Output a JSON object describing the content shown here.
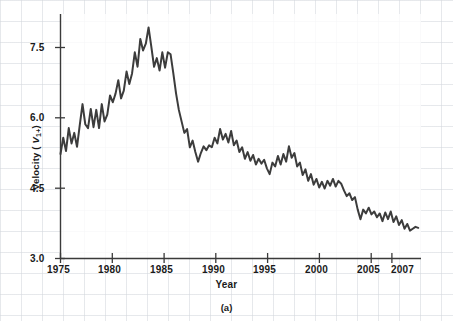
{
  "chart_data": {
    "type": "line",
    "title": "",
    "caption": "(a)",
    "xlabel": "Year",
    "ylabel_plain": "Velocity (V1+)",
    "ylabel_prefix": "Velocity ( ",
    "ylabel_var": "V",
    "ylabel_sub": "1+",
    "ylabel_suffix": ")",
    "xlim": [
      1975,
      2007.75
    ],
    "ylim": [
      3.0,
      8.1
    ],
    "xticks": [
      1975,
      1980,
      1985,
      1990,
      1995,
      2000,
      2005,
      2007
    ],
    "xtick_labels": [
      "1975",
      "1980",
      "1985",
      "1990",
      "1995",
      "2000",
      "2005",
      "2007"
    ],
    "yticks": [
      3.0,
      4.5,
      6.0,
      7.5
    ],
    "ytick_labels": [
      "3.0",
      "4.5",
      "6.0",
      "7.5"
    ],
    "grid": "faint-background-plaid",
    "legend": "none",
    "line_color": "#3c3c3c",
    "axis_color": "#3a3a3a",
    "frequency": "quarterly",
    "series": [
      {
        "name": "Velocity (V1+)",
        "x": [
          1975.0,
          1975.25,
          1975.5,
          1975.75,
          1976.0,
          1976.25,
          1976.5,
          1976.75,
          1977.0,
          1977.25,
          1977.5,
          1977.75,
          1978.0,
          1978.25,
          1978.5,
          1978.75,
          1979.0,
          1979.25,
          1979.5,
          1979.75,
          1980.0,
          1980.25,
          1980.5,
          1980.75,
          1981.0,
          1981.25,
          1981.5,
          1981.75,
          1982.0,
          1982.25,
          1982.5,
          1982.75,
          1983.0,
          1983.25,
          1983.5,
          1983.75,
          1984.0,
          1984.25,
          1984.5,
          1984.75,
          1985.0,
          1985.25,
          1985.5,
          1985.75,
          1986.0,
          1986.25,
          1986.5,
          1986.75,
          1987.0,
          1987.25,
          1987.5,
          1987.75,
          1988.0,
          1988.25,
          1988.5,
          1988.75,
          1989.0,
          1989.25,
          1989.5,
          1989.75,
          1990.0,
          1990.25,
          1990.5,
          1990.75,
          1991.0,
          1991.25,
          1991.5,
          1991.75,
          1992.0,
          1992.25,
          1992.5,
          1992.75,
          1993.0,
          1993.25,
          1993.5,
          1993.75,
          1994.0,
          1994.25,
          1994.5,
          1994.75,
          1995.0,
          1995.25,
          1995.5,
          1995.75,
          1996.0,
          1996.25,
          1996.5,
          1996.75,
          1997.0,
          1997.25,
          1997.5,
          1997.75,
          1998.0,
          1998.25,
          1998.5,
          1998.75,
          1999.0,
          1999.25,
          1999.5,
          1999.75,
          2000.0,
          2000.25,
          2000.5,
          2000.75,
          2001.0,
          2001.25,
          2001.5,
          2001.75,
          2002.0,
          2002.25,
          2002.5,
          2002.75,
          2003.0,
          2003.25,
          2003.5,
          2003.75,
          2004.0,
          2004.25,
          2004.5,
          2004.75,
          2005.0,
          2005.25,
          2005.5,
          2005.75,
          2006.0,
          2006.25,
          2006.5,
          2006.75,
          2007.0,
          2007.25,
          2007.5
        ],
        "values": [
          5.18,
          5.52,
          5.24,
          5.72,
          5.4,
          5.62,
          5.33,
          5.78,
          6.22,
          5.8,
          5.72,
          6.12,
          5.74,
          6.1,
          5.72,
          6.22,
          5.86,
          6.0,
          6.4,
          6.26,
          6.44,
          6.72,
          6.34,
          6.5,
          6.9,
          6.64,
          6.86,
          7.3,
          7.0,
          7.58,
          7.34,
          7.48,
          7.82,
          7.42,
          7.0,
          7.18,
          6.92,
          7.3,
          6.98,
          7.3,
          7.26,
          6.86,
          6.44,
          6.1,
          5.86,
          5.62,
          5.7,
          5.32,
          5.46,
          5.22,
          5.02,
          5.2,
          5.34,
          5.26,
          5.36,
          5.32,
          5.52,
          5.4,
          5.7,
          5.48,
          5.6,
          5.42,
          5.66,
          5.36,
          5.46,
          5.22,
          5.32,
          5.08,
          5.22,
          5.04,
          5.16,
          4.96,
          5.08,
          4.98,
          5.06,
          4.88,
          4.76,
          5.0,
          4.92,
          5.14,
          4.96,
          5.18,
          5.02,
          5.34,
          5.1,
          5.2,
          4.92,
          5.0,
          4.74,
          4.86,
          4.62,
          4.76,
          4.54,
          4.66,
          4.48,
          4.6,
          4.46,
          4.62,
          4.52,
          4.66,
          4.5,
          4.62,
          4.56,
          4.42,
          4.3,
          4.36,
          4.22,
          4.28,
          4.02,
          3.82,
          4.02,
          3.94,
          4.06,
          3.92,
          3.98,
          3.86,
          3.94,
          3.78,
          3.96,
          3.82,
          3.98,
          3.76,
          3.88,
          3.7,
          3.8,
          3.62,
          3.72,
          3.58,
          3.62,
          3.66,
          3.64
        ]
      }
    ]
  }
}
